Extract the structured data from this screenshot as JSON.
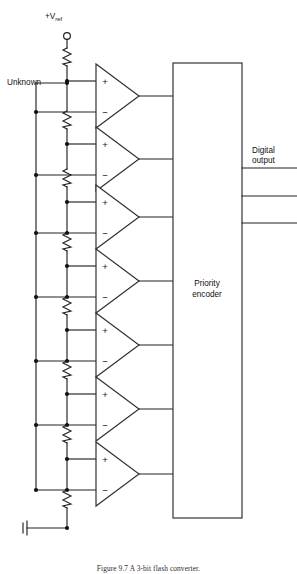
{
  "figure": {
    "caption_prefix": "Figure 9.7",
    "caption_text": "A 3-bit flash converter.",
    "caption_full": "Figure 9.7   A 3-bit flash converter."
  },
  "labels": {
    "vref_main": "+V",
    "vref_subscript": "ref",
    "unknown_input": "Unknown",
    "digital_output_line1": "Digital",
    "digital_output_line2": "output",
    "encoder_line1": "Priority",
    "encoder_line2": "encoder",
    "plus_sign": "+",
    "minus_sign": "−"
  },
  "circuit": {
    "comparator_count": 7,
    "ladder_resistor_count": 8,
    "digital_output_count": 3,
    "ladder_tap_count": 7,
    "unknown_node_count": 7
  },
  "colors": {
    "background": "#ffffff",
    "wire": "#222222",
    "outline": "#333333",
    "text": "#111111",
    "caption": "#2b2b2b"
  },
  "geometry": {
    "width": 297,
    "height": 574,
    "ladder_x": 67,
    "unknown_bus_x": 36,
    "comparator_left_x": 96,
    "comparator_tip_x": 139,
    "encoder_box": {
      "x": 173,
      "y": 63,
      "w": 69,
      "h": 455
    },
    "comparator_rows": [
      {
        "index": 1,
        "center_y": 96
      },
      {
        "index": 2,
        "center_y": 159
      },
      {
        "index": 3,
        "center_y": 217
      },
      {
        "index": 4,
        "center_y": 281
      },
      {
        "index": 5,
        "center_y": 345
      },
      {
        "index": 6,
        "center_y": 409
      },
      {
        "index": 7,
        "center_y": 474
      }
    ],
    "ladder_taps_y": [
      81,
      144,
      202,
      266,
      330,
      394,
      459
    ],
    "unknown_taps_y": [
      112,
      175,
      233,
      297,
      361,
      425,
      490
    ],
    "digital_output_y": [
      168,
      196,
      223
    ],
    "vref_terminal": {
      "cx": 67,
      "cy": 36,
      "r": 3.4
    },
    "ground": {
      "x": 25,
      "y": 528
    }
  }
}
